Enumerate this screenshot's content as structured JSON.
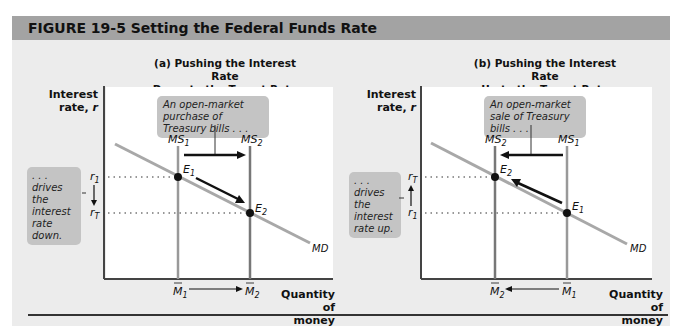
{
  "figure": {
    "title": "FIGURE  19-5  Setting the Federal Funds Rate"
  },
  "panel_a": {
    "title": "(a) Pushing the Interest Rate\nDown to the Target Rate",
    "y_label": "Interest rate, r",
    "x_label": "Quantity of money",
    "top_callout": "An open-market purchase of Treasury bills . . .",
    "side_callout": ". . . drives the interest rate down.",
    "supply_curves": [
      "MS1",
      "MS2"
    ],
    "demand_curve": "MD",
    "points": [
      "E1",
      "E2"
    ],
    "r_ticks": [
      "r1",
      "rT"
    ],
    "m_ticks": [
      "M1",
      "M2"
    ]
  },
  "panel_b": {
    "title": "(b) Pushing the Interest Rate\nUp to the Target Rate",
    "y_label": "Interest rate, r",
    "x_label": "Quantity of money",
    "top_callout": "An open-market sale of Treasury bills . . .",
    "side_callout": ". . . drives the interest rate up.",
    "supply_curves": [
      "MS2",
      "MS1"
    ],
    "demand_curve": "MD",
    "points": [
      "E2",
      "E1"
    ],
    "r_ticks": [
      "rT",
      "r1"
    ],
    "m_ticks": [
      "M2",
      "M1"
    ]
  },
  "colors": {
    "header_bar": "#a3a3a3",
    "background": "#ececec",
    "callout": "#c4c4c4",
    "curve": "#a0a0a0",
    "supply_line": "#909090",
    "arrow": "#111111"
  }
}
